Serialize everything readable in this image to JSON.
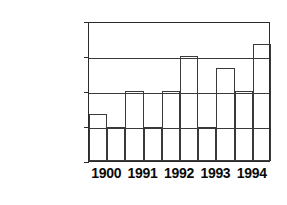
{
  "chart_data": {
    "type": "bar",
    "title": "",
    "subtitle": "",
    "xlabel": "",
    "ylabel": "",
    "grid": true,
    "legend_position": "none",
    "categories": [
      "1900",
      "1991",
      "1992",
      "1993",
      "1994"
    ],
    "ylim": [
      0,
      2000000
    ],
    "ytick_labels": [
      "0",
      "500,000",
      "1,000,000",
      "1,500,000",
      "2,000,000"
    ],
    "ytick_values": [
      0,
      500000,
      1000000,
      1500000,
      2000000
    ],
    "series": [
      {
        "name": "Series 1",
        "values": [
          670000,
          1000000,
          1000000,
          480000,
          1000000
        ]
      },
      {
        "name": "Series 2",
        "values": [
          480000,
          480000,
          1500000,
          1330000,
          1670000
        ]
      }
    ]
  },
  "axis": {
    "y_labels": [
      "2,000,000",
      "1,500,000",
      "1,000,000",
      "500,000",
      "0"
    ],
    "x_labels": [
      "1900",
      "1991",
      "1992",
      "1993",
      "1994"
    ]
  }
}
